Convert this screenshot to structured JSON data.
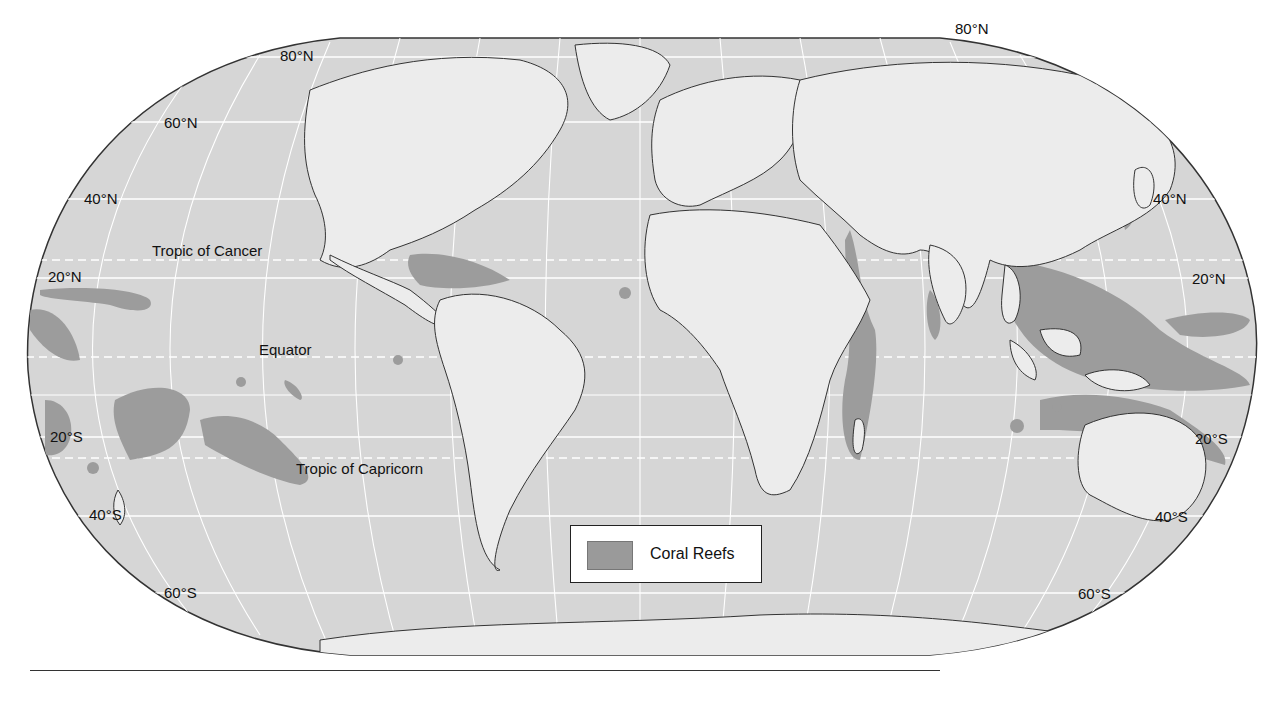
{
  "map": {
    "projection": "Robinson world map",
    "colors": {
      "ocean": "#d6d6d6",
      "land": "#ececec",
      "coral_reef": "#9c9c9c",
      "graticule": "#ffffff",
      "border": "#333333"
    },
    "latitude_labels": {
      "left": [
        "80°N",
        "60°N",
        "40°N",
        "20°N",
        "20°S",
        "40°S",
        "60°S"
      ],
      "right": [
        "80°N",
        "40°N",
        "20°N",
        "20°S",
        "40°S",
        "60°S"
      ]
    },
    "reference_lines": {
      "tropic_of_cancer": "Tropic of Cancer",
      "equator": "Equator",
      "tropic_of_capricorn": "Tropic of Capricorn"
    },
    "legend": {
      "items": [
        {
          "label": "Coral Reefs",
          "color": "#9c9c9c"
        }
      ]
    }
  }
}
